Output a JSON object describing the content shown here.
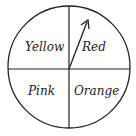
{
  "spinner": {
    "sections": [
      {
        "label": "Yellow",
        "position": "top-left"
      },
      {
        "label": "Red",
        "position": "top-right"
      },
      {
        "label": "Pink",
        "position": "bottom-left"
      },
      {
        "label": "Orange",
        "position": "bottom-right"
      }
    ],
    "pointer": {
      "direction": "up-right",
      "points_to": "Red"
    },
    "stroke_color": "#222222",
    "background_color": "#ffffff"
  }
}
